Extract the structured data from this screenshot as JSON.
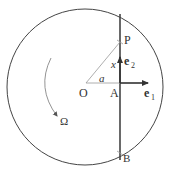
{
  "diagram": {
    "labels": {
      "origin": "O",
      "foot": "A",
      "point_p": "P",
      "point_b": "B",
      "distance_a": "a",
      "coordinate_x": "x",
      "unit_e1": "e",
      "unit_e1_sub": "1",
      "unit_e2": "e",
      "unit_e2_sub": "2",
      "rotation": "Ω"
    },
    "colors": {
      "stroke": "#444444",
      "light_stroke": "#999999",
      "text": "#333333"
    }
  }
}
